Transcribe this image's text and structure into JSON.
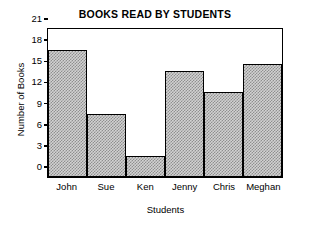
{
  "chart_data": {
    "type": "bar",
    "title": "BOOKS READ BY STUDENTS",
    "xlabel": "Students",
    "ylabel": "Number of Books",
    "categories": [
      "John",
      "Sue",
      "Ken",
      "Jenny",
      "Chris",
      "Meghan"
    ],
    "values": [
      18,
      9,
      3,
      15,
      12,
      16
    ],
    "ylim": [
      0,
      21
    ],
    "yticks": [
      0,
      3,
      6,
      9,
      12,
      15,
      18,
      21
    ],
    "ytick_labels": [
      "0",
      "3",
      "6",
      "9",
      "12",
      "15",
      "18",
      "21"
    ],
    "grid": false,
    "legend": false,
    "bar_fill": "#d2d2d2",
    "bar_edge": "#000000",
    "frame_color": "#000000",
    "background": "#ffffff"
  }
}
